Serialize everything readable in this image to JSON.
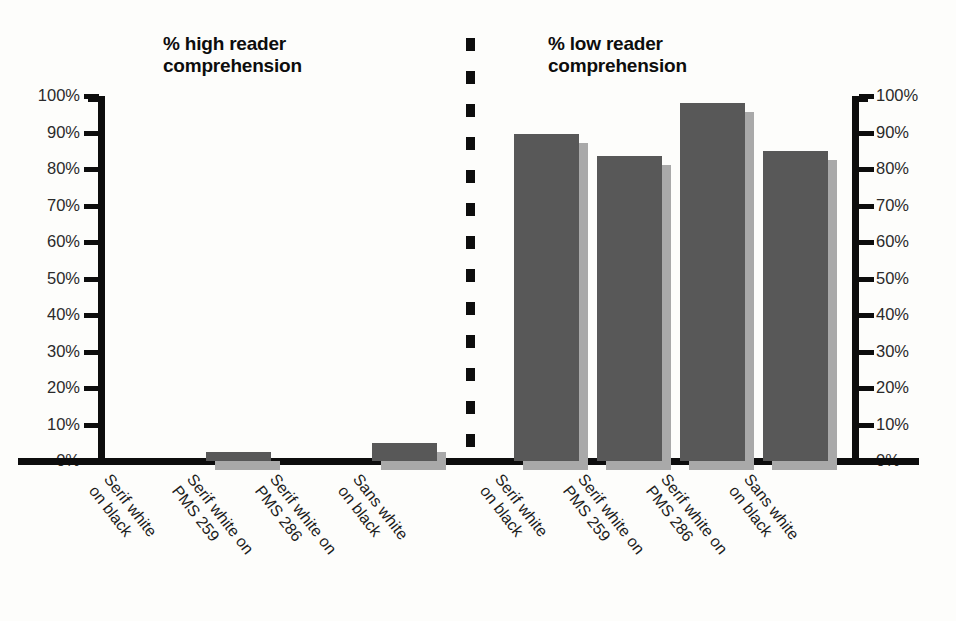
{
  "chart_data": {
    "type": "bar",
    "title": "",
    "panels": [
      {
        "id": "high",
        "title": "% high reader\ncomprehension",
        "categories": [
          "Serif white\non black",
          "Serif white on\nPMS 259",
          "Serif white on\nPMS 286",
          "Sans white\non black"
        ],
        "values": [
          0,
          2.5,
          0,
          5
        ],
        "ylabel": "",
        "ylim": [
          0,
          100
        ]
      },
      {
        "id": "low",
        "title": "% low reader\ncomprehension",
        "categories": [
          "Serif white\non black",
          "Serif white on\nPMS 259",
          "Serif white on\nPMS 286",
          "Sans white\non black"
        ],
        "values": [
          89.5,
          83.5,
          98,
          85
        ],
        "ylabel": "",
        "ylim": [
          0,
          100
        ]
      }
    ],
    "y_ticks": [
      "100%",
      "90%",
      "80%",
      "70%",
      "60%",
      "50%",
      "40%",
      "30%",
      "20%",
      "10%",
      "0%"
    ],
    "y_tick_values": [
      100,
      90,
      80,
      70,
      60,
      50,
      40,
      30,
      20,
      10,
      0
    ],
    "xlabel": "",
    "grid": false,
    "legend": null,
    "divider": "dashed-vertical",
    "colors": {
      "bar_face": "#585858",
      "bar_shadow": "#a9a9a9",
      "axis": "#0d0d0d",
      "text": "#1c1c1c",
      "background": "#fdfdfb"
    }
  }
}
